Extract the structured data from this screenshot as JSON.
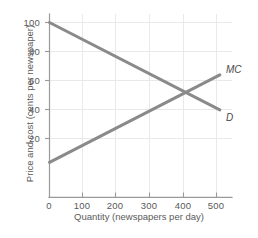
{
  "chart_data": {
    "type": "line",
    "title": "",
    "xlabel": "Quantity (newspapers per day)",
    "ylabel": "Price and cost (cents per newspaper)",
    "xlim": [
      0,
      520
    ],
    "ylim": [
      0,
      105
    ],
    "xticks": [
      0,
      100,
      200,
      300,
      400,
      500
    ],
    "yticks": [
      0,
      20,
      40,
      60,
      80,
      100
    ],
    "xtick_labels": [
      "0",
      "100",
      "200",
      "300",
      "400",
      "500"
    ],
    "ytick_labels": [
      "0",
      "20",
      "40",
      "60",
      "80",
      "100"
    ],
    "grid": true,
    "legend": "inline-right",
    "line_color": "#8a8a8a",
    "grid_color": "#e8e8e8",
    "axis_color": "#9a9a9a",
    "series": [
      {
        "name": "MC",
        "label": "MC",
        "description": "Marginal cost, upward sloping",
        "x": [
          0,
          510
        ],
        "values": [
          20,
          70
        ]
      },
      {
        "name": "D",
        "label": "D",
        "description": "Demand, downward sloping",
        "x": [
          0,
          510
        ],
        "values": [
          100,
          50
        ]
      }
    ],
    "intersection": {
      "x": 400,
      "y": 60
    }
  }
}
